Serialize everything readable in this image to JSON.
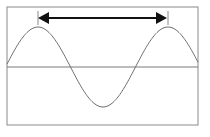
{
  "diagram": {
    "type": "wave-wavelength",
    "colors": {
      "frame": "#8a8a8a",
      "axis": "#7a7a7a",
      "wave": "#6e6e6e",
      "arrow": "#111111",
      "tick": "#8a8a8a",
      "background": "#ffffff"
    },
    "frame": {
      "x": 7,
      "y": 7,
      "width": 191,
      "height": 118
    },
    "axis_y": 67,
    "wave": {
      "x_start": 7,
      "x_end": 198,
      "amplitude": 40,
      "peak1_x": 38,
      "peak2_x": 168
    },
    "arrow": {
      "x1": 38,
      "x2": 167,
      "y": 18,
      "label": ""
    }
  }
}
